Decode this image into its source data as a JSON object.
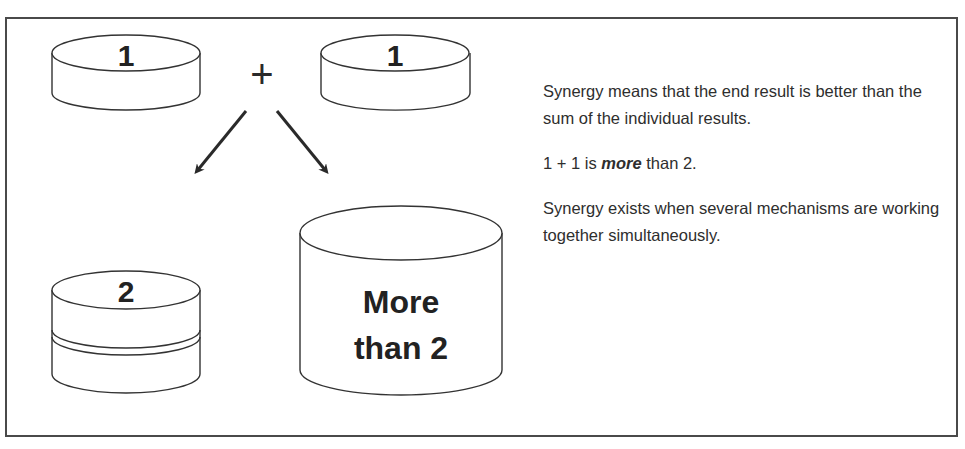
{
  "diagram": {
    "top_left_cylinder_label": "1",
    "operator_symbol": "+",
    "top_right_cylinder_label": "1",
    "bottom_left_cylinder_label": "2",
    "bottom_right_cylinder_label_line1": "More",
    "bottom_right_cylinder_label_line2": "than 2",
    "arrows": [
      "arrow-down-left",
      "arrow-down-right"
    ]
  },
  "caption": {
    "paragraph1": "Synergy means that the end result is better than the sum of the individual results.",
    "paragraph2_prefix": "1 + 1 is ",
    "paragraph2_emphasis": "more",
    "paragraph2_suffix": " than 2.",
    "paragraph3": "Synergy exists when several mechanisms are working together simultaneously."
  },
  "colors": {
    "stroke": "#333333",
    "text": "#2e2e2e",
    "frame": "#4a4a4a"
  }
}
